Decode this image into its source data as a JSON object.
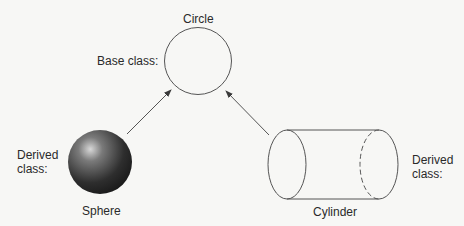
{
  "diagram": {
    "nodes": {
      "circle": {
        "name": "Circle",
        "role": "Base class:"
      },
      "sphere": {
        "name": "Sphere",
        "role": "Derived class:"
      },
      "cylinder": {
        "name": "Cylinder",
        "role": "Derived class:"
      }
    },
    "edges": [
      {
        "from": "Sphere",
        "to": "Circle"
      },
      {
        "from": "Cylinder",
        "to": "Circle"
      }
    ],
    "colors": {
      "stroke": "#4a4a4a",
      "background": "#f7f7f5"
    }
  }
}
